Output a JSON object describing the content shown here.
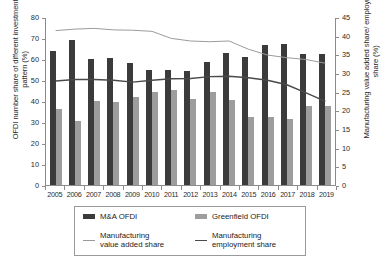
{
  "chart_data": {
    "type": "bar",
    "title": "",
    "xlabel": "",
    "ylabel": "OFDI number share of different investment pattern (%)",
    "y2label": "Manufacturing value added share/ employment share (%)",
    "categories": [
      "2005",
      "2006",
      "2007",
      "2008",
      "2009",
      "2010",
      "2011",
      "2012",
      "2013",
      "2014",
      "2015",
      "2016",
      "2017",
      "2018",
      "2019"
    ],
    "ylim": [
      0,
      80
    ],
    "y2lim": [
      0,
      45
    ],
    "yticks": [
      0,
      10,
      20,
      30,
      40,
      50,
      60,
      70,
      80
    ],
    "y2ticks": [
      0,
      5,
      10,
      15,
      20,
      25,
      30,
      35,
      40,
      45
    ],
    "grid": false,
    "legend_position": "below",
    "series": [
      {
        "name": "M&A OFDI",
        "axis": "left",
        "kind": "bar",
        "color": "#3b3b3b",
        "values": [
          64.0,
          69.0,
          60.0,
          60.3,
          58.0,
          54.8,
          55.0,
          54.2,
          58.5,
          63.0,
          61.0,
          66.5,
          67.0,
          62.5,
          62.5
        ]
      },
      {
        "name": "Greenfield OFDI",
        "axis": "left",
        "kind": "bar",
        "color": "#9d9d9d",
        "values": [
          36.0,
          30.5,
          40.0,
          39.4,
          41.8,
          44.4,
          45.2,
          41.0,
          44.5,
          40.5,
          32.5,
          32.5,
          31.5,
          37.8,
          37.5
        ]
      },
      {
        "name": "Manufacturing value added share",
        "axis": "right",
        "kind": "line",
        "color": "#9a9a9a",
        "values": [
          41.6,
          42.0,
          42.2,
          41.8,
          41.7,
          41.4,
          39.5,
          38.8,
          38.6,
          38.8,
          36.6,
          35.0,
          34.3,
          33.8,
          32.8
        ]
      },
      {
        "name": "Manufacturing employment share",
        "axis": "right",
        "kind": "line",
        "color": "#4a4a4a",
        "values": [
          28.0,
          28.4,
          28.4,
          28.2,
          27.7,
          28.2,
          28.6,
          28.7,
          29.2,
          29.3,
          28.9,
          28.2,
          27.0,
          24.8,
          22.5
        ]
      }
    ]
  },
  "legend": {
    "items": [
      {
        "label": "M&A OFDI",
        "marker": "bar-dark"
      },
      {
        "label": "Greenfield OFDI",
        "marker": "bar-gray"
      },
      {
        "label_line1": "Manufacturing",
        "label_line2": "value added share",
        "marker": "line-light"
      },
      {
        "label_line1": "Manufacturing",
        "label_line2": "employment share",
        "marker": "line-dark"
      }
    ]
  },
  "colors": {
    "ma_bar": "#3b3b3b",
    "gf_bar": "#9d9d9d",
    "value_added_line": "#9a9a9a",
    "employment_line": "#4a4a4a",
    "axis": "#8c8c8c"
  }
}
